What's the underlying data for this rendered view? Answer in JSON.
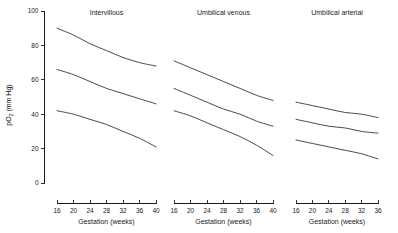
{
  "figure": {
    "background": "#ffffff",
    "line_color": "#2b2b2b",
    "axis_color": "#1a1a1a"
  },
  "yaxis": {
    "label_main": "pO",
    "label_sub": "2",
    "label_unit": " (mm Hg)",
    "label_full": "pO2 (mm Hg)",
    "min": 0,
    "max": 100,
    "ticks": [
      0,
      20,
      40,
      60,
      80,
      100
    ],
    "tick_labels": [
      "0",
      "20",
      "40",
      "60",
      "80",
      "100"
    ]
  },
  "xaxis": {
    "label": "Gestation (weeks)",
    "tick_step": 4
  },
  "chart_data": {
    "type": "line",
    "title": "",
    "xlabel": "Gestation (weeks)",
    "ylabel": "pO2 (mm Hg)",
    "ylim": [
      0,
      100
    ],
    "grid": false,
    "legend": "none",
    "panels": [
      {
        "title": "Intervillous",
        "x": [
          16,
          20,
          24,
          28,
          32,
          36,
          40
        ],
        "xlim": [
          16,
          40
        ],
        "xticks": [
          16,
          20,
          24,
          28,
          32,
          36,
          40
        ],
        "xtick_labels": [
          "16",
          "20",
          "24",
          "28",
          "32",
          "36",
          "40"
        ],
        "series": [
          {
            "name": "upper centile",
            "values": [
              90,
              86,
              81,
              77,
              73,
              70,
              68
            ]
          },
          {
            "name": "median",
            "values": [
              66,
              63,
              59,
              55,
              52,
              49,
              46
            ]
          },
          {
            "name": "lower centile",
            "values": [
              42,
              40,
              37,
              34,
              30,
              26,
              21
            ]
          }
        ]
      },
      {
        "title": "Umbilical venous",
        "x": [
          16,
          20,
          24,
          28,
          32,
          36,
          40
        ],
        "xlim": [
          16,
          40
        ],
        "xticks": [
          16,
          20,
          24,
          28,
          32,
          36,
          40
        ],
        "xtick_labels": [
          "16",
          "20",
          "24",
          "28",
          "32",
          "36",
          "40"
        ],
        "series": [
          {
            "name": "upper centile",
            "values": [
              71,
              67,
              63,
              59,
              55,
              51,
              48
            ]
          },
          {
            "name": "median",
            "values": [
              55,
              51,
              47,
              43,
              40,
              36,
              33
            ]
          },
          {
            "name": "lower centile",
            "values": [
              42,
              39,
              35,
              31,
              27,
              22,
              16
            ]
          }
        ]
      },
      {
        "title": "Umbilical arterial",
        "x": [
          16,
          20,
          24,
          28,
          32,
          36
        ],
        "xlim": [
          16,
          36
        ],
        "xticks": [
          16,
          20,
          24,
          28,
          32,
          36
        ],
        "xtick_labels": [
          "16",
          "20",
          "24",
          "28",
          "32",
          "36"
        ],
        "series": [
          {
            "name": "upper centile",
            "values": [
              47,
              45,
              43,
              41,
              40,
              38
            ]
          },
          {
            "name": "median",
            "values": [
              37,
              35,
              33,
              32,
              30,
              29
            ]
          },
          {
            "name": "lower centile",
            "values": [
              25,
              23,
              21,
              19,
              17,
              14
            ]
          }
        ]
      }
    ]
  }
}
